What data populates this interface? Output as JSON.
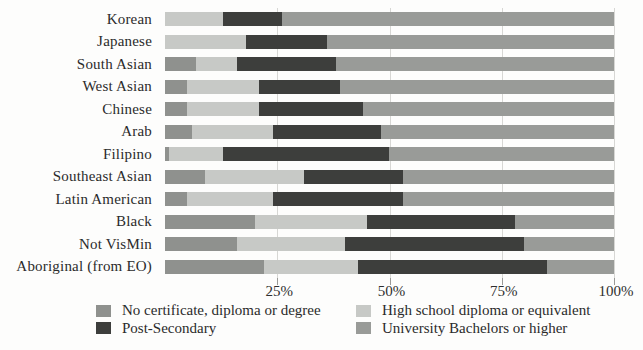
{
  "chart_data": {
    "type": "bar",
    "variant": "horizontal-stacked",
    "unit": "percent",
    "categories": [
      "Korean",
      "Japanese",
      "South Asian",
      "West Asian",
      "Chinese",
      "Arab",
      "Filipino",
      "Southeast Asian",
      "Latin American",
      "Black",
      "Not VisMin",
      "Aboriginal (from EO)"
    ],
    "series": [
      {
        "name": "No certificate, diploma or degree",
        "color": "#8f918e",
        "values": [
          0,
          0,
          7,
          5,
          5,
          6,
          1,
          9,
          5,
          20,
          16,
          22
        ]
      },
      {
        "name": "High school diploma or equivalent",
        "color": "#c7c9c6",
        "values": [
          13,
          18,
          9,
          16,
          16,
          18,
          12,
          22,
          19,
          25,
          24,
          21
        ]
      },
      {
        "name": "Post-Secondary",
        "color": "#3d3e3c",
        "values": [
          13,
          18,
          22,
          18,
          23,
          24,
          37,
          22,
          29,
          33,
          40,
          42
        ]
      },
      {
        "name": "University Bachelors or higher",
        "color": "#999b98",
        "values": [
          74,
          64,
          62,
          61,
          56,
          52,
          50,
          47,
          47,
          22,
          20,
          15
        ]
      }
    ],
    "x_axis": {
      "ticks": [
        "25%",
        "50%",
        "75%",
        "100%"
      ],
      "tick_values": [
        25,
        50,
        75,
        100
      ],
      "range": [
        0,
        100
      ],
      "gridlines": true
    },
    "legend": {
      "position": "bottom",
      "columns": [
        [
          "No certificate, diploma or degree",
          "Post-Secondary"
        ],
        [
          "High school diploma or equivalent",
          "University Bachelors or higher"
        ]
      ]
    },
    "title": "",
    "xlabel": "",
    "ylabel": ""
  }
}
